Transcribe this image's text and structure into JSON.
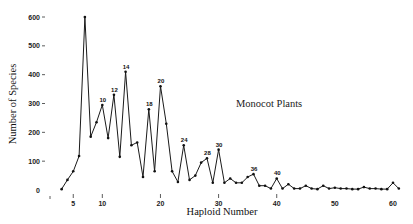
{
  "chart_data": {
    "type": "line",
    "title": "",
    "annotation": "Monocot Plants",
    "xlabel": "Haploid Number",
    "ylabel": "Number of Species",
    "xlim": [
      1,
      61
    ],
    "ylim": [
      0,
      600
    ],
    "grid": false,
    "legend": null,
    "x_ticks": [
      1,
      5,
      10,
      20,
      30,
      40,
      50,
      60
    ],
    "y_ticks": [
      0,
      100,
      200,
      300,
      400,
      500,
      600
    ],
    "x": [
      3,
      4,
      5,
      6,
      7,
      8,
      9,
      10,
      11,
      12,
      13,
      14,
      15,
      16,
      17,
      18,
      19,
      20,
      21,
      22,
      23,
      24,
      25,
      26,
      27,
      28,
      29,
      30,
      31,
      32,
      33,
      34,
      35,
      36,
      37,
      38,
      39,
      40,
      41,
      42,
      43,
      44,
      45,
      46,
      47,
      48,
      49,
      50,
      51,
      52,
      53,
      54,
      55,
      56,
      57,
      58,
      59,
      60,
      61
    ],
    "values": [
      3,
      35,
      65,
      118,
      600,
      185,
      235,
      295,
      180,
      330,
      115,
      410,
      155,
      165,
      45,
      280,
      65,
      360,
      230,
      65,
      28,
      155,
      35,
      50,
      95,
      110,
      25,
      140,
      25,
      40,
      25,
      25,
      45,
      55,
      15,
      15,
      5,
      40,
      5,
      20,
      5,
      5,
      15,
      5,
      3,
      15,
      5,
      8,
      5,
      5,
      3,
      3,
      10,
      5,
      5,
      3,
      3,
      25,
      5
    ],
    "point_labels": [
      10,
      12,
      14,
      18,
      20,
      24,
      28,
      30,
      36,
      40
    ]
  }
}
